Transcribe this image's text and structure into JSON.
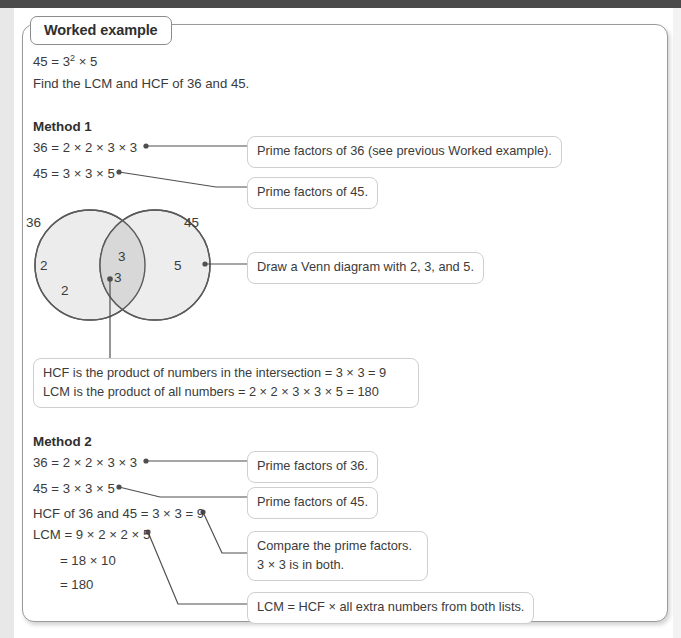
{
  "panel": {
    "tab_label": "Worked example",
    "intro_line_1_prefix": "45 = 3",
    "intro_line_1_sup": "2",
    "intro_line_1_suffix": " × 5",
    "intro_line_2": "Find the LCM and HCF of 36 and 45."
  },
  "method1": {
    "heading": "Method 1",
    "line_36": "36 = 2 × 2 × 3 × 3",
    "line_45": "45 = 3 × 3 × 5",
    "callout_36": "Prime factors of 36 (see previous Worked example).",
    "callout_45": "Prime factors of 45.",
    "callout_venn": "Draw a Venn diagram with 2, 3, and 5.",
    "venn": {
      "left_label": "36",
      "right_label": "45",
      "left_only_1": "2",
      "left_only_2": "2",
      "intersection_1": "3",
      "intersection_2": "3",
      "right_only": "5"
    },
    "result_line_1": "HCF is the product of numbers in the intersection = 3 × 3 = 9",
    "result_line_2": "LCM is the product of all numbers = 2 × 2 × 3 × 3 × 5 = 180"
  },
  "method2": {
    "heading": "Method 2",
    "line_36": "36 = 2 × 2 × 3 × 3",
    "line_45": "45 = 3 × 3 × 5",
    "line_hcf": "HCF of 36 and 45 = 3 × 3 = 9",
    "line_lcm": "LCM = 9 × 2 × 2 × 5",
    "line_lcm_cont_1": "= 18 × 10",
    "line_lcm_cont_2": "= 180",
    "callout_36": "Prime factors of 36.",
    "callout_45": "Prime factors of 45.",
    "callout_compare_line_1": "Compare the prime factors.",
    "callout_compare_line_2": "3 × 3 is in both.",
    "callout_lcm_rule": "LCM = HCF × all extra numbers from both lists."
  },
  "colors": {
    "panel_border": "#9a9a9a",
    "callout_border": "#cfcfcf",
    "text": "#3b3b3b",
    "leader_line": "#4f4f4f",
    "venn_fill": "#ececec",
    "venn_intersection_fill": "#d8d8d8",
    "venn_stroke": "#5a5a5a",
    "top_bar": "#4a4a4a"
  }
}
